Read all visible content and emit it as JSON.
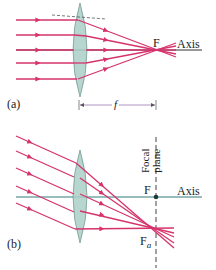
{
  "figure": {
    "colors": {
      "ray": "#d6336c",
      "lens_fill": "#a9cfc7",
      "lens_stroke": "#7a9c95",
      "axis_a": "#333333",
      "axis_b": "#2e7d7a",
      "dashed": "#555555",
      "dimension": "#9a7ab0",
      "text": "#222222"
    },
    "panel_a": {
      "label": "(a)",
      "focal_point_label": "F",
      "axis_label": "Axis",
      "focal_length_label": "f",
      "lens": {
        "cx": 80,
        "top": 3,
        "bottom": 97,
        "half_width": 12
      },
      "axis_y": 50,
      "focal_point": {
        "x": 158,
        "y": 50
      },
      "incoming_ray_y": [
        20,
        35,
        50,
        63,
        79
      ]
    },
    "panel_b": {
      "label": "(b)",
      "focal_point_label": "F",
      "off_axis_focus_label": "F",
      "off_axis_focus_subscript": "a",
      "axis_label": "Axis",
      "focal_plane_label_line1": "Focal",
      "focal_plane_label_line2": "plane",
      "lens": {
        "cx": 80,
        "top": 150,
        "bottom": 243,
        "half_width": 12
      },
      "axis_y": 197,
      "focal_plane_x": 156,
      "focal_point": {
        "x": 156,
        "y": 197
      },
      "off_axis_focus": {
        "x": 156,
        "y": 228
      }
    }
  }
}
